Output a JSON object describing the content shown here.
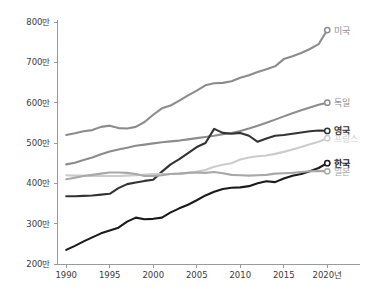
{
  "chart_data": {
    "type": "line",
    "title": "",
    "subtitle": "",
    "xlabel": "",
    "ylabel": "",
    "x": [
      1990,
      1991,
      1992,
      1993,
      1994,
      1995,
      1996,
      1997,
      1998,
      1999,
      2000,
      2001,
      2002,
      2003,
      2004,
      2005,
      2006,
      2007,
      2008,
      2009,
      2010,
      2011,
      2012,
      2013,
      2014,
      2015,
      2016,
      2017,
      2018,
      2019,
      2020
    ],
    "xlim": [
      1989,
      2021
    ],
    "ylim": [
      2000000,
      8000000
    ],
    "grid": false,
    "legend_position": "right-inline",
    "x_tick_labels": [
      "1990",
      "1995",
      "2000",
      "2005",
      "2010",
      "2015",
      "2020년"
    ],
    "x_ticks": [
      1990,
      1995,
      2000,
      2005,
      2010,
      2015,
      2020
    ],
    "y_tick_labels": [
      "200만",
      "300만",
      "400만",
      "500만",
      "600만",
      "700만",
      "800만"
    ],
    "y_ticks": [
      2000000,
      3000000,
      4000000,
      5000000,
      6000000,
      7000000,
      8000000
    ],
    "unit_note": "만 = 10,000",
    "series": [
      {
        "name": "미국",
        "label": "미국",
        "color": "#8c8c8c",
        "bold": false,
        "values": [
          5200000,
          5240000,
          5290000,
          5320000,
          5400000,
          5430000,
          5370000,
          5360000,
          5400000,
          5520000,
          5700000,
          5860000,
          5930000,
          6050000,
          6180000,
          6300000,
          6430000,
          6480000,
          6490000,
          6530000,
          6620000,
          6680000,
          6760000,
          6830000,
          6900000,
          7080000,
          7150000,
          7230000,
          7330000,
          7450000,
          7800000
        ]
      },
      {
        "name": "독일",
        "label": "독일",
        "color": "#8c8c8c",
        "bold": false,
        "values": [
          4470000,
          4510000,
          4580000,
          4640000,
          4720000,
          4790000,
          4840000,
          4880000,
          4930000,
          4960000,
          4990000,
          5020000,
          5040000,
          5060000,
          5090000,
          5120000,
          5150000,
          5180000,
          5220000,
          5250000,
          5300000,
          5360000,
          5430000,
          5500000,
          5580000,
          5660000,
          5740000,
          5810000,
          5880000,
          5950000,
          6000000
        ]
      },
      {
        "name": "영국",
        "label": "영국",
        "color": "#333333",
        "bold": true,
        "values": [
          3680000,
          3680000,
          3690000,
          3700000,
          3720000,
          3740000,
          3880000,
          3980000,
          4020000,
          4060000,
          4090000,
          4290000,
          4470000,
          4600000,
          4750000,
          4900000,
          5000000,
          5350000,
          5250000,
          5230000,
          5250000,
          5180000,
          5030000,
          5110000,
          5180000,
          5200000,
          5230000,
          5260000,
          5290000,
          5310000,
          5300000
        ]
      },
      {
        "name": "프랑스",
        "label": "프랑스",
        "color": "#cccccc",
        "bold": false,
        "values": [
          4200000,
          4190000,
          4190000,
          4180000,
          4180000,
          4180000,
          4180000,
          4190000,
          4200000,
          4220000,
          4230000,
          4230000,
          4230000,
          4240000,
          4260000,
          4290000,
          4330000,
          4410000,
          4460000,
          4500000,
          4590000,
          4640000,
          4670000,
          4690000,
          4730000,
          4780000,
          4840000,
          4900000,
          4970000,
          5030000,
          5120000
        ]
      },
      {
        "name": "한국",
        "label": "한국",
        "color": "#1a1a1a",
        "bold": true,
        "values": [
          2350000,
          2450000,
          2560000,
          2660000,
          2760000,
          2830000,
          2900000,
          3050000,
          3150000,
          3110000,
          3120000,
          3150000,
          3280000,
          3380000,
          3470000,
          3580000,
          3700000,
          3790000,
          3860000,
          3890000,
          3900000,
          3930000,
          4000000,
          4050000,
          4030000,
          4120000,
          4190000,
          4230000,
          4300000,
          4380000,
          4500000
        ]
      },
      {
        "name": "일본",
        "label": "일본",
        "color": "#a8a8a8",
        "bold": false,
        "values": [
          4100000,
          4140000,
          4180000,
          4210000,
          4240000,
          4270000,
          4270000,
          4260000,
          4230000,
          4180000,
          4180000,
          4200000,
          4230000,
          4240000,
          4260000,
          4270000,
          4260000,
          4280000,
          4250000,
          4210000,
          4200000,
          4190000,
          4200000,
          4210000,
          4240000,
          4250000,
          4260000,
          4280000,
          4300000,
          4310000,
          4300000
        ]
      }
    ],
    "series_label_positions": [
      {
        "name": "미국",
        "y_value": 7800000
      },
      {
        "name": "독일",
        "y_value": 6000000
      },
      {
        "name": "영국",
        "y_value": 5300000
      },
      {
        "name": "프랑스",
        "y_value": 5120000
      },
      {
        "name": "한국",
        "y_value": 4500000
      },
      {
        "name": "일본",
        "y_value": 4300000
      }
    ]
  }
}
